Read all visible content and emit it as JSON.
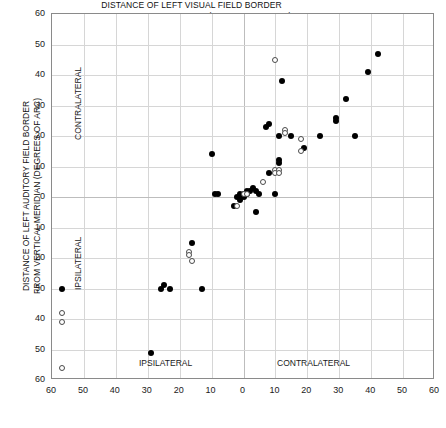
{
  "figure": {
    "name": "auditory-visual-field-border-scatter"
  },
  "axes": {
    "x_title_line1": "DISTANCE OF LEFT VISUAL FIELD BORDER",
    "x_title_line2": "FROM VERTICAL MERIDIAN (DEGREES OF ARC)",
    "y_title_line1": "DISTANCE OF LEFT AUDITORY FIELD BORDER",
    "y_title_line2": "FROM VERTICAL MERIDIAN (DEGREES OF ARC)",
    "x_ticks": [
      "60",
      "50",
      "40",
      "30",
      "20",
      "10",
      "0",
      "10",
      "20",
      "30",
      "40",
      "50",
      "60"
    ],
    "y_ticks": [
      "60",
      "50",
      "40",
      "30",
      "20",
      "10",
      "0",
      "10",
      "20",
      "30",
      "40",
      "50",
      "60"
    ]
  },
  "regions": {
    "x_left": "IPSILATERAL",
    "x_right": "CONTRALATERAL",
    "y_top": "CONTRALATERAL",
    "y_bottom": "IPSILATERAL"
  },
  "chart_data": {
    "type": "scatter",
    "title": "",
    "xlabel": "DISTANCE OF LEFT VISUAL FIELD BORDER FROM VERTICAL MERIDIAN (DEGREES OF ARC)",
    "ylabel": "DISTANCE OF LEFT AUDITORY FIELD BORDER FROM VERTICAL MERIDIAN (DEGREES OF ARC)",
    "xlim": [
      -60,
      60
    ],
    "ylim": [
      -60,
      60
    ],
    "x_tick_values": [
      -60,
      -50,
      -40,
      -30,
      -20,
      -10,
      0,
      10,
      20,
      30,
      40,
      50,
      60
    ],
    "y_tick_values": [
      -60,
      -50,
      -40,
      -30,
      -20,
      -10,
      0,
      10,
      20,
      30,
      40,
      50,
      60
    ],
    "x_axis_note": "negative = IPSILATERAL (left half), positive = CONTRALATERAL (right half)",
    "y_axis_note": "positive = CONTRALATERAL (upper half), negative = IPSILATERAL (lower half)",
    "grid": true,
    "legend": "none",
    "series": [
      {
        "name": "filled-circles",
        "marker": "filled circle",
        "color": "#000000",
        "points": [
          [
            42,
            47
          ],
          [
            39,
            41
          ],
          [
            32,
            32
          ],
          [
            35,
            20
          ],
          [
            29,
            26
          ],
          [
            29,
            25
          ],
          [
            24,
            20
          ],
          [
            19,
            16
          ],
          [
            12,
            38
          ],
          [
            8,
            24
          ],
          [
            7,
            23
          ],
          [
            11,
            20
          ],
          [
            11,
            12
          ],
          [
            11,
            11
          ],
          [
            15,
            20
          ],
          [
            8,
            8
          ],
          [
            10,
            1
          ],
          [
            5,
            1
          ],
          [
            4,
            2
          ],
          [
            3,
            3
          ],
          [
            2,
            2
          ],
          [
            1,
            2
          ],
          [
            1,
            1
          ],
          [
            0,
            1
          ],
          [
            0,
            0
          ],
          [
            -1,
            1
          ],
          [
            -1,
            0
          ],
          [
            -1,
            -1
          ],
          [
            -2,
            0
          ],
          [
            -3,
            -3
          ],
          [
            -8,
            1
          ],
          [
            -9,
            1
          ],
          [
            4,
            -5
          ],
          [
            -10,
            14
          ],
          [
            -16,
            -15
          ],
          [
            -13,
            -30
          ],
          [
            -23,
            -30
          ],
          [
            -25,
            -29
          ],
          [
            -26,
            -30
          ],
          [
            -57,
            -30
          ],
          [
            -29,
            -51
          ]
        ]
      },
      {
        "name": "open-circles",
        "marker": "open circle",
        "color": "#ffffff",
        "edge_color": "#4a4a4a",
        "points": [
          [
            10,
            45
          ],
          [
            13,
            22
          ],
          [
            13,
            21
          ],
          [
            18,
            19
          ],
          [
            18,
            15
          ],
          [
            10,
            9
          ],
          [
            11,
            9
          ],
          [
            10,
            8
          ],
          [
            11,
            8
          ],
          [
            6,
            5
          ],
          [
            0,
            1
          ],
          [
            1,
            1
          ],
          [
            -2,
            -3
          ],
          [
            -17,
            -18
          ],
          [
            -17,
            -19
          ],
          [
            -16,
            -21
          ],
          [
            -57,
            -38
          ],
          [
            -57,
            -41
          ],
          [
            -57,
            -56
          ]
        ]
      }
    ]
  }
}
